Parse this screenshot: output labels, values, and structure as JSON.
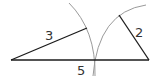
{
  "diagram": {
    "type": "triangle-construction",
    "colors": {
      "segment": "#1a1a1a",
      "arc": "#9a9a9a",
      "label": "#333333"
    },
    "segments": [
      {
        "id": "base",
        "label": "5",
        "x1": 11,
        "y1": 60,
        "x2": 149,
        "y2": 60
      },
      {
        "id": "left-side",
        "label": "3",
        "x1": 11,
        "y1": 60,
        "x2": 87,
        "y2": 28
      },
      {
        "id": "right-side",
        "label": "2",
        "x1": 149,
        "y1": 60,
        "x2": 119,
        "y2": 15
      }
    ],
    "labels": [
      {
        "text": "3",
        "x": 45,
        "y": 40
      },
      {
        "text": "2",
        "x": 135,
        "y": 37
      },
      {
        "text": "5",
        "x": 77,
        "y": 75
      }
    ],
    "arcs": [
      {
        "id": "arc-from-left",
        "path": "M 69 3 Q 96 30 95 76"
      },
      {
        "id": "arc-from-right",
        "path": "M 146 5 Q 98 12 93 76"
      }
    ]
  }
}
